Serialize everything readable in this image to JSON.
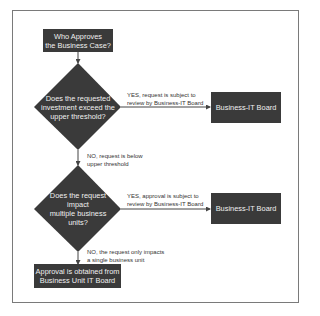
{
  "flowchart": {
    "start": {
      "line1": "Who Approves",
      "line2": "the Business Case?"
    },
    "decision1": {
      "line1": "Does the requested",
      "line2": "investment exceed the",
      "line3": "upper threshold?"
    },
    "yes1": {
      "line1": "YES, request is subject to",
      "line2": "review by Business-IT Board"
    },
    "board1": {
      "label": "Business-IT Board"
    },
    "no1": {
      "line1": "NO, request is below",
      "line2": "upper threshold"
    },
    "decision2": {
      "line1": "Does the request",
      "line2": "impact",
      "line3": "multiple business",
      "line4": "units?"
    },
    "yes2": {
      "line1": "YES, approval is subject to",
      "line2": "review by Business-IT Board"
    },
    "board2": {
      "label": "Business-IT Board"
    },
    "no2": {
      "line1": "NO, the request only impacts",
      "line2": "a single business unit"
    },
    "end": {
      "line1": "Approval is obtained from",
      "line2": "Business Unit IT Board"
    }
  },
  "colors": {
    "node": "#3a3a3a",
    "node_text": "#f0f0f0",
    "line": "#444444",
    "frame": "#7a7a7a"
  }
}
